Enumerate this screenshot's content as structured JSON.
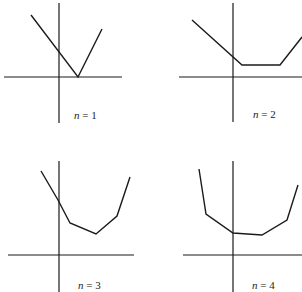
{
  "panels": [
    {
      "label_var": "n",
      "label_rest": " = 1",
      "label_pos": [
        74,
        119
      ],
      "y_axis": {
        "x": 59,
        "y1": 3,
        "y2": 123
      },
      "x_axis": {
        "y": 77,
        "x1": 4,
        "x2": 122
      },
      "points": [
        [
          31,
          15
        ],
        [
          78,
          77
        ],
        [
          102,
          29
        ]
      ]
    },
    {
      "label_var": "n",
      "label_rest": " = 2",
      "label_pos": [
        253,
        118
      ],
      "y_axis": {
        "x": 233,
        "y1": 3,
        "y2": 122
      },
      "x_axis": {
        "y": 77,
        "x1": 179,
        "x2": 302
      },
      "points": [
        [
          192,
          20
        ],
        [
          242,
          65
        ],
        [
          280,
          65
        ],
        [
          302,
          37
        ]
      ]
    },
    {
      "label_var": "n",
      "label_rest": " = 3",
      "label_pos": [
        78,
        289
      ],
      "y_axis": {
        "x": 59,
        "y1": 161,
        "y2": 292
      },
      "x_axis": {
        "y": 255,
        "x1": 8,
        "x2": 134
      },
      "points": [
        [
          41,
          171
        ],
        [
          58,
          200
        ],
        [
          70,
          223
        ],
        [
          96,
          234
        ],
        [
          117,
          216
        ],
        [
          130,
          177
        ]
      ]
    },
    {
      "label_var": "n",
      "label_rest": " = 4",
      "label_pos": [
        252,
        289
      ],
      "y_axis": {
        "x": 233,
        "y1": 161,
        "y2": 292
      },
      "x_axis": {
        "y": 255,
        "x1": 183,
        "x2": 302
      },
      "points": [
        [
          199,
          169
        ],
        [
          206,
          214
        ],
        [
          233,
          233
        ],
        [
          262,
          235
        ],
        [
          287,
          220
        ],
        [
          298,
          185
        ]
      ]
    }
  ],
  "labels": [
    "n = 1",
    "n = 2",
    "n = 3",
    "n = 4"
  ]
}
